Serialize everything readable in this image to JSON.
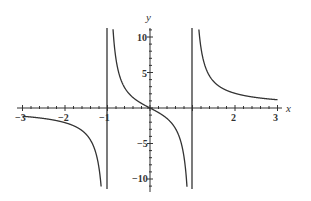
{
  "chart_data": {
    "type": "line",
    "title": "",
    "xlabel": "x",
    "ylabel": "y",
    "xlim": [
      -3,
      3
    ],
    "ylim": [
      -12,
      12
    ],
    "x_ticks": [
      -3,
      -2,
      -1,
      2,
      3
    ],
    "y_ticks": [
      10,
      5,
      -5,
      -10
    ],
    "grid": false,
    "legend": null,
    "vertical_asymptotes": [
      -1,
      1
    ],
    "series": [
      {
        "name": "f(x)",
        "description": "rational function with vertical asymptotes at x = -1 and x = 1, passing through origin",
        "x": [
          -3,
          -2.5,
          -2,
          -1.5,
          -1.2,
          -1.1,
          0.5,
          -0.5,
          0,
          0.5,
          1.1,
          1.2,
          1.5,
          2,
          2.5,
          3
        ],
        "points": [
          [
            -3,
            -1.1
          ],
          [
            -2.5,
            -1.4
          ],
          [
            -2,
            -2.2
          ],
          [
            -1.5,
            -3.6
          ],
          [
            -1.2,
            -8.2
          ],
          [
            -1.13,
            -12
          ],
          [
            -0.87,
            12
          ],
          [
            -0.7,
            4.1
          ],
          [
            -0.5,
            2.3
          ],
          [
            -0.25,
            0.8
          ],
          [
            0,
            0
          ],
          [
            0.25,
            -0.8
          ],
          [
            0.5,
            -2.3
          ],
          [
            0.7,
            -4.1
          ],
          [
            0.87,
            -12
          ],
          [
            1.13,
            12
          ],
          [
            1.2,
            8.2
          ],
          [
            1.5,
            3.6
          ],
          [
            2,
            2.2
          ],
          [
            2.5,
            1.4
          ],
          [
            3,
            1.1
          ]
        ]
      }
    ]
  },
  "labels": {
    "x_axis": "x",
    "y_axis": "y",
    "xt_m3": "−3",
    "xt_m2": "−2",
    "xt_m1": "−1",
    "xt_2": "2",
    "xt_3": "3",
    "yt_10": "10",
    "yt_5": "5",
    "yt_m5": "−5",
    "yt_m10": "−10"
  },
  "colors": {
    "curve": "#333333",
    "axes": "#333333",
    "background": "#ffffff"
  }
}
